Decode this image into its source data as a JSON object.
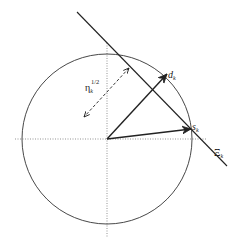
{
  "diagram": {
    "type": "geometric-vector-diagram",
    "colors": {
      "stroke": "#222222",
      "axis": "#777777",
      "background": "#ffffff"
    },
    "circle": {
      "cx": 107,
      "cy": 139,
      "r": 85
    },
    "axes": {
      "horizontal": {
        "x1": 15,
        "y1": 139,
        "x2": 207,
        "y2": 139,
        "style": "dotted"
      },
      "vertical": {
        "x1": 107,
        "y1": 43,
        "x2": 107,
        "y2": 238,
        "style": "dotted"
      }
    },
    "hyperplane": {
      "x1": 77,
      "y1": 12,
      "x2": 227,
      "y2": 166,
      "label": "Ξ",
      "label_sub": "k"
    },
    "vectors": [
      {
        "name": "d_k",
        "x1": 107,
        "y1": 139,
        "x2": 167,
        "y2": 74,
        "label": "d",
        "label_sub": "k"
      },
      {
        "name": "s_k",
        "x1": 107,
        "y1": 139,
        "x2": 191,
        "y2": 129,
        "label": "s",
        "label_sub": "k"
      }
    ],
    "distance_arrow": {
      "x1": 129,
      "y1": 68,
      "x2": 84,
      "y2": 117,
      "style": "dashed",
      "double_headed": true,
      "label": "η",
      "label_sub": "k",
      "label_sup": "1/2"
    }
  }
}
